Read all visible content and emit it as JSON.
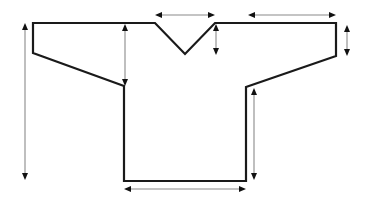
{
  "diagram": {
    "type": "garment-schematic",
    "colors": {
      "outline": "#1a1a1a",
      "dimension_line": "#8a8a8a",
      "arrowhead": "#111111",
      "background": "#ffffff"
    },
    "outline_points": [
      [
        33,
        23
      ],
      [
        155,
        23
      ],
      [
        185,
        54
      ],
      [
        215,
        23
      ],
      [
        336,
        23
      ],
      [
        336,
        56
      ],
      [
        246,
        87
      ],
      [
        246,
        181
      ],
      [
        124,
        181
      ],
      [
        124,
        86
      ],
      [
        33,
        53
      ]
    ],
    "dimensions": [
      {
        "id": "neck-width",
        "orientation": "horizontal",
        "from": [
          156,
          15
        ],
        "to": [
          214,
          15
        ],
        "labels": "none"
      },
      {
        "id": "shoulder-width",
        "orientation": "horizontal",
        "from": [
          249,
          15
        ],
        "to": [
          335,
          15
        ],
        "labels": "none"
      },
      {
        "id": "neck-depth",
        "orientation": "vertical",
        "from": [
          216,
          26
        ],
        "to": [
          216,
          54
        ],
        "labels": "none"
      },
      {
        "id": "cuff-height",
        "orientation": "vertical",
        "from": [
          347,
          26
        ],
        "to": [
          347,
          55
        ],
        "labels": "none"
      },
      {
        "id": "armhole-depth",
        "orientation": "vertical",
        "from": [
          125,
          25
        ],
        "to": [
          125,
          85
        ],
        "labels": "none"
      },
      {
        "id": "total-length",
        "orientation": "vertical",
        "from": [
          25,
          23
        ],
        "to": [
          25,
          179
        ],
        "labels": "none"
      },
      {
        "id": "side-length",
        "orientation": "vertical",
        "from": [
          254,
          89
        ],
        "to": [
          254,
          179
        ],
        "labels": "none"
      },
      {
        "id": "bottom-width",
        "orientation": "horizontal",
        "from": [
          125,
          189
        ],
        "to": [
          245,
          189
        ],
        "labels": "none"
      }
    ]
  }
}
